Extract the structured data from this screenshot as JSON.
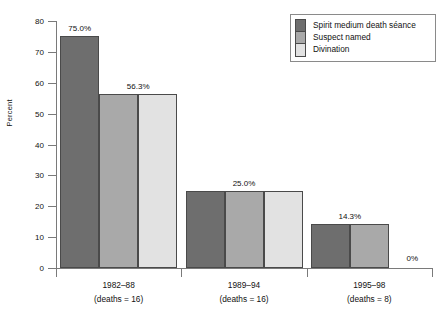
{
  "chart_data": {
    "type": "bar",
    "title": "",
    "subtitle": "",
    "xlabel": "",
    "ylabel": "Percent",
    "ylim": [
      0,
      80
    ],
    "yticks": [
      0,
      10,
      20,
      30,
      40,
      50,
      60,
      70,
      80
    ],
    "ytick_labels": [
      "0",
      "10",
      "20",
      "30",
      "40",
      "50",
      "60",
      "70",
      "80"
    ],
    "grid": false,
    "legend_position": "top-right",
    "categories": [
      "1982–88",
      "1989–94",
      "1995–98"
    ],
    "category_sublabels": [
      "(deaths = 16)",
      "(deaths = 16)",
      "(deaths = 8)"
    ],
    "series": [
      {
        "name": "Spirit medium death séance",
        "color": "#6e6e6e",
        "values": [
          75.0,
          25.0,
          14.3
        ],
        "labels": [
          "75.0%",
          "25.0%",
          "14.3%"
        ]
      },
      {
        "name": "Suspect named",
        "color": "#a9a9a9",
        "values": [
          56.3,
          25.0,
          14.3
        ],
        "labels": [
          "56.3%",
          "",
          ""
        ]
      },
      {
        "name": "Divination",
        "color": "#e2e2e2",
        "values": [
          56.3,
          25.0,
          0
        ],
        "labels": [
          "",
          "",
          "0%"
        ]
      }
    ],
    "annotations": [
      {
        "text": "75.0%",
        "group": "1982–88",
        "series": "Spirit medium death séance",
        "value": 75.0
      },
      {
        "text": "56.3%",
        "group": "1982–88",
        "series": "Suspect named / Divination",
        "value": 56.3
      },
      {
        "text": "25.0%",
        "group": "1989–94",
        "series": "all",
        "value": 25.0
      },
      {
        "text": "14.3%",
        "group": "1995–98",
        "series": "Spirit medium death séance / Suspect named",
        "value": 14.3
      },
      {
        "text": "0%",
        "group": "1995–98",
        "series": "Divination",
        "value": 0
      }
    ],
    "bar_labels": [
      "75.0%",
      "56.3%",
      "25.0%",
      "14.3%",
      "0%"
    ]
  },
  "legend": {
    "entries": [
      {
        "label": "Spirit medium death séance",
        "color": "#6e6e6e"
      },
      {
        "label": "Suspect named",
        "color": "#a9a9a9"
      },
      {
        "label": "Divination",
        "color": "#e2e2e2"
      }
    ]
  },
  "axis": {
    "y_title": "Percent"
  },
  "colors": {
    "axis": "#7a7a7a",
    "bar_outline": "#4a4a4a",
    "text": "#111111",
    "background": "#ffffff"
  }
}
